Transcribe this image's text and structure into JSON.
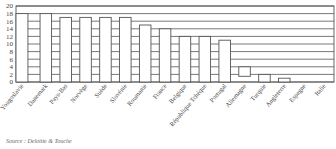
{
  "chart_data": {
    "type": "bar",
    "title": "",
    "xlabel": "",
    "ylabel": "",
    "ylim": [
      0,
      20
    ],
    "yticks": [
      0,
      2,
      4,
      6,
      8,
      10,
      12,
      14,
      16,
      18,
      20
    ],
    "grid": true,
    "legend": null,
    "categories": [
      "Yougoslavie",
      "Danemark",
      "Pays-Bas",
      "Norvège",
      "Suède",
      "Slovénie",
      "Roumanie",
      "France",
      "Belgique",
      "République Tchèque",
      "Portugal",
      "Allemagne",
      "Turquie",
      "Angleterre",
      "Espagne",
      "Italie"
    ],
    "values": [
      18,
      18,
      17,
      17,
      17,
      17,
      15,
      14,
      12,
      12,
      11,
      4,
      2,
      1,
      0,
      0
    ],
    "bar_bottoms": [
      0,
      0,
      0,
      0,
      0,
      0,
      0,
      0,
      0,
      0,
      0,
      1.5,
      0,
      0,
      0,
      0
    ]
  },
  "source": "Source : Deloitte & Touche",
  "colors": {
    "bar_fill": "#ffffff",
    "bar_stroke": "#555555",
    "grid": "#555555"
  }
}
